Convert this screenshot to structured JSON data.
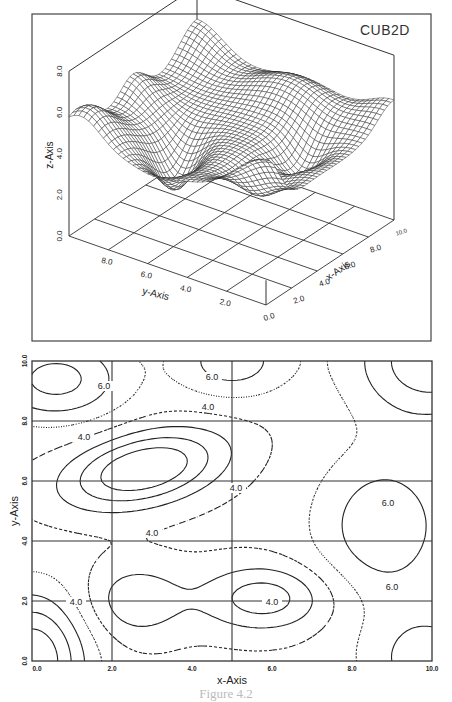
{
  "figure": {
    "caption": "Figure 4.2"
  },
  "chart_data": [
    {
      "type": "surface3d",
      "title": "CUB2D",
      "xlabel": "x-Axis",
      "ylabel": "y-Axis",
      "zlabel": "z-Axis",
      "xlim": [
        0,
        10
      ],
      "ylim": [
        0,
        10
      ],
      "zlim": [
        0,
        8
      ],
      "x_ticks": [
        "0.0",
        "2.0",
        "4.0",
        "6.0",
        "8.0",
        "10.0"
      ],
      "y_ticks": [
        "0.0",
        "2.0",
        "4.0",
        "6.0",
        "8.0"
      ],
      "z_ticks": [
        "0.0",
        "2.0",
        "4.0",
        "6.0",
        "8.0"
      ],
      "mesh": "wireframe grid, 41x41",
      "description": "Cubic-spline interpolated surface with a ridge toward high y and x, a trough near (2.5,6.3), and a low region near (5.5,2)"
    },
    {
      "type": "contour",
      "title": "",
      "xlabel": "x-Axis",
      "ylabel": "y-Axis",
      "xlim": [
        0,
        10
      ],
      "ylim": [
        0,
        10
      ],
      "x_ticks": [
        "0.0",
        "2.0",
        "4.0",
        "6.0",
        "8.0",
        "10.0"
      ],
      "y_ticks": [
        "0.0",
        "2.0",
        "4.0",
        "6.0",
        "8.0",
        "10.0"
      ],
      "grid_x": [
        2,
        5
      ],
      "grid_y": [
        2,
        4,
        6,
        8
      ],
      "contour_levels": [
        3.0,
        3.5,
        4.0,
        4.5,
        5.0,
        5.5,
        6.0,
        6.5,
        7.0
      ],
      "contour_labels": [
        {
          "text": "6.0",
          "x": 1.8,
          "y": 9.1
        },
        {
          "text": "6.0",
          "x": 4.5,
          "y": 9.4
        },
        {
          "text": "4.0",
          "x": 4.4,
          "y": 8.4
        },
        {
          "text": "4.0",
          "x": 1.3,
          "y": 7.4
        },
        {
          "text": "4.0",
          "x": 5.1,
          "y": 5.7
        },
        {
          "text": "4.0",
          "x": 3.0,
          "y": 4.2
        },
        {
          "text": "6.0",
          "x": 8.9,
          "y": 5.2
        },
        {
          "text": "4.0",
          "x": 6.0,
          "y": 1.9
        },
        {
          "text": "6.0",
          "x": 9.0,
          "y": 2.4
        },
        {
          "text": "4.0",
          "x": 1.1,
          "y": 1.9
        }
      ],
      "line_styles": [
        "solid",
        "long-dash",
        "dash-dot",
        "short-dash",
        "dotted"
      ]
    }
  ]
}
